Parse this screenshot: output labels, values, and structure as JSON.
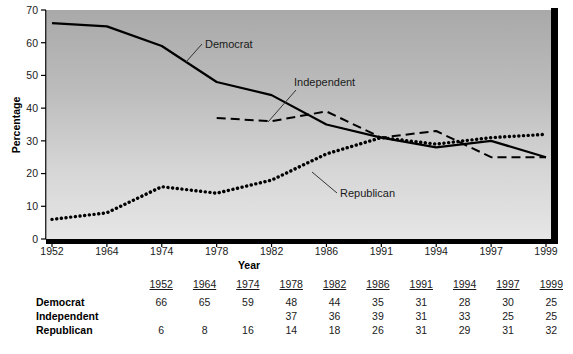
{
  "chart_data": {
    "type": "line",
    "title": "",
    "xlabel": "Year",
    "ylabel": "Percentage",
    "categories": [
      "1952",
      "1964",
      "1974",
      "1978",
      "1982",
      "1986",
      "1991",
      "1994",
      "1997",
      "1999"
    ],
    "ylim": [
      0,
      70
    ],
    "yticks": [
      0,
      10,
      20,
      30,
      40,
      50,
      60,
      70
    ],
    "grid": false,
    "legend_position": "inline-annotations",
    "series": [
      {
        "name": "Democrat",
        "style": "solid",
        "values": [
          66,
          65,
          59,
          48,
          44,
          35,
          31,
          28,
          30,
          25
        ]
      },
      {
        "name": "Independent",
        "style": "dashed",
        "values": [
          null,
          null,
          null,
          37,
          36,
          39,
          31,
          33,
          25,
          25
        ]
      },
      {
        "name": "Republican",
        "style": "dotted",
        "values": [
          6,
          8,
          16,
          14,
          18,
          26,
          31,
          29,
          31,
          32
        ]
      }
    ],
    "annotations": [
      {
        "text": "Democrat",
        "series": "Democrat"
      },
      {
        "text": "Independent",
        "series": "Independent"
      },
      {
        "text": "Republican",
        "series": "Republican"
      }
    ]
  },
  "table": {
    "corner_label": "",
    "column_headers": [
      "1952",
      "1964",
      "1974",
      "1978",
      "1982",
      "1986",
      "1991",
      "1994",
      "1997",
      "1999"
    ],
    "rows": [
      {
        "label": "Democrat",
        "values": [
          "66",
          "65",
          "59",
          "48",
          "44",
          "35",
          "31",
          "28",
          "30",
          "25"
        ]
      },
      {
        "label": "Independent",
        "values": [
          "",
          "",
          "",
          "37",
          "36",
          "39",
          "31",
          "33",
          "25",
          "25"
        ]
      },
      {
        "label": "Republican",
        "values": [
          "6",
          "8",
          "16",
          "14",
          "18",
          "26",
          "31",
          "29",
          "31",
          "32"
        ]
      }
    ]
  },
  "colors": {
    "ink": "#000000",
    "plot_bg_top": "#b0b0b0",
    "plot_bg_bottom": "#e4e4e4",
    "axis": "#000000"
  }
}
